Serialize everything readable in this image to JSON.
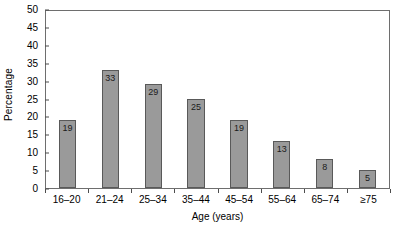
{
  "chart_data": {
    "type": "bar",
    "title": "",
    "xlabel": "Age (years)",
    "ylabel": "Percentage",
    "categories": [
      "16–20",
      "21–24",
      "25–34",
      "35–44",
      "45–54",
      "55–64",
      "65–74",
      "≥75"
    ],
    "values": [
      19,
      33,
      29,
      25,
      19,
      13,
      8,
      5
    ],
    "value_labels": [
      "19",
      "33",
      "29",
      "25",
      "19",
      "13",
      "8",
      "5"
    ],
    "ylim": [
      0,
      50
    ],
    "ytick_values": [
      0,
      5,
      10,
      15,
      20,
      25,
      30,
      35,
      40,
      45,
      50
    ],
    "ytick_labels": [
      "0",
      "5",
      "10",
      "15",
      "20",
      "25",
      "30",
      "35",
      "40",
      "45",
      "50"
    ],
    "grid": false,
    "legend": false,
    "bar_color": "#9a9a9a",
    "bar_edge_color": "#595959",
    "axis_color": "#6e6e6e",
    "background": "#ffffff"
  }
}
